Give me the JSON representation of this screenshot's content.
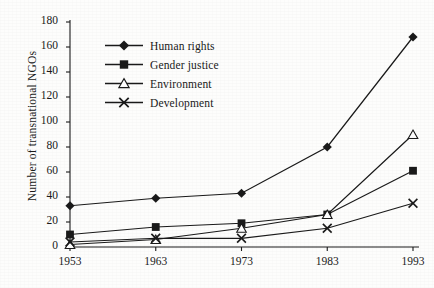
{
  "chart_data": {
    "type": "line",
    "title": "",
    "xlabel": "",
    "ylabel": "Number of transnational NGOs",
    "categories": [
      1953,
      1963,
      1973,
      1983,
      1993
    ],
    "xtick_labels": [
      "1953",
      "1963",
      "1973",
      "1983",
      "1993"
    ],
    "ytick_labels": [
      "0",
      "20",
      "40",
      "60",
      "80",
      "100",
      "120",
      "140",
      "160",
      "180"
    ],
    "ylim": [
      0,
      180
    ],
    "ytick_step": 20,
    "grid": false,
    "legend_position": "upper-left-inside",
    "series": [
      {
        "name": "Human rights",
        "marker": "diamond",
        "color": "#1a1a1a",
        "values": [
          33,
          39,
          43,
          80,
          168
        ]
      },
      {
        "name": "Gender justice",
        "marker": "square",
        "color": "#1a1a1a",
        "values": [
          10,
          16,
          19,
          26,
          61
        ]
      },
      {
        "name": "Environment",
        "marker": "triangle-open",
        "color": "#1a1a1a",
        "values": [
          2,
          6,
          15,
          26,
          90
        ]
      },
      {
        "name": "Development",
        "marker": "x",
        "color": "#1a1a1a",
        "values": [
          4,
          7,
          7,
          15,
          35
        ]
      }
    ]
  },
  "axis": {
    "y_title": "Number of transnational NGOs"
  },
  "legend": {
    "items": [
      {
        "label": "Human rights"
      },
      {
        "label": "Gender justice"
      },
      {
        "label": "Environment"
      },
      {
        "label": "Development"
      }
    ]
  }
}
